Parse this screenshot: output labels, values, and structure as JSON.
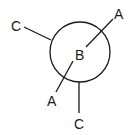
{
  "diagram": {
    "type": "newman-projection",
    "front_atom": {
      "label": "B"
    },
    "front_bonds": [
      {
        "label": "A",
        "position": "upper-right"
      },
      {
        "label": "A",
        "position": "lower-left"
      }
    ],
    "back_bonds": [
      {
        "label": "C",
        "position": "upper-left"
      },
      {
        "label": "C",
        "position": "bottom"
      }
    ]
  }
}
